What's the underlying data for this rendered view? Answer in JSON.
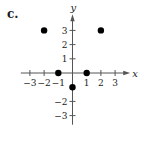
{
  "panel": {
    "label": "c."
  },
  "chart_data": {
    "type": "scatter",
    "title": "",
    "xlabel": "x",
    "ylabel": "y",
    "xlim": [
      -3.5,
      3.5
    ],
    "ylim": [
      -3.5,
      4
    ],
    "grid": false,
    "legend": null,
    "x_ticks": [
      -3,
      -2,
      -1,
      1,
      2,
      3
    ],
    "y_ticks": [
      -3,
      -2,
      1,
      2,
      3
    ],
    "x_tick_labels": [
      "−3",
      "−2",
      "−1",
      "1",
      "2",
      "3"
    ],
    "y_tick_labels": [
      "−3",
      "−2",
      "1",
      "2",
      "3"
    ],
    "points": [
      {
        "x": -2,
        "y": 3
      },
      {
        "x": 2,
        "y": 3
      },
      {
        "x": -1,
        "y": 0
      },
      {
        "x": 1,
        "y": 0
      },
      {
        "x": 0,
        "y": -1
      }
    ],
    "point_color": "#000000",
    "axis_color": "#555555"
  }
}
